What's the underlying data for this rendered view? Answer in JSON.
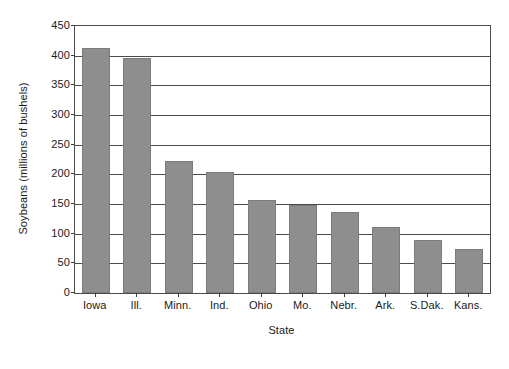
{
  "chart_data": {
    "type": "bar",
    "title": "",
    "xlabel": "State",
    "ylabel": "Soybeans (millions of bushels)",
    "categories": [
      "Iowa",
      "Ill.",
      "Minn.",
      "Ind.",
      "Ohio",
      "Mo.",
      "Nebr.",
      "Ark.",
      "S.Dak.",
      "Kans."
    ],
    "values": [
      413,
      396,
      223,
      204,
      157,
      148,
      136,
      112,
      90,
      75
    ],
    "ylim": [
      0,
      450
    ],
    "ytick_step": 50,
    "yticks": [
      0,
      50,
      100,
      150,
      200,
      250,
      300,
      350,
      400,
      450
    ],
    "ytick_labels": [
      "0",
      "50",
      "100",
      "150",
      "200",
      "250",
      "300",
      "350",
      "400",
      "450"
    ],
    "grid": "horizontal",
    "legend": "none",
    "bar_color": "#8e8e8e",
    "axis_color": "#4a4a4a"
  }
}
